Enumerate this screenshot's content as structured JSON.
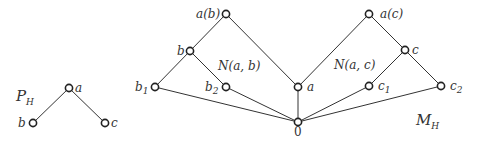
{
  "diagrams": [
    {
      "name": "P_H",
      "title": "P",
      "title_sub": "H",
      "title_pos": [
        16,
        101
      ],
      "nodes": [
        {
          "id": "a",
          "label": "a",
          "x": 69,
          "y": 88,
          "lx": 75,
          "ly": 92
        },
        {
          "id": "b",
          "label": "b",
          "x": 33,
          "y": 123,
          "lx": 18,
          "ly": 127
        },
        {
          "id": "c",
          "label": "c",
          "x": 105,
          "y": 123,
          "lx": 111,
          "ly": 127
        }
      ],
      "edges": [
        [
          "a",
          "b"
        ],
        [
          "a",
          "c"
        ]
      ]
    },
    {
      "name": "M_H",
      "title": "M",
      "title_sub": "H",
      "title_pos": [
        416,
        125
      ],
      "nodes": [
        {
          "id": "ab",
          "label": "a(b)",
          "x": 226,
          "y": 14,
          "lx": 196,
          "ly": 18
        },
        {
          "id": "b",
          "label": "b",
          "x": 190,
          "y": 51,
          "lx": 177,
          "ly": 55
        },
        {
          "id": "b1",
          "label": "b",
          "sub": "1",
          "x": 155,
          "y": 87,
          "lx": 135,
          "ly": 91
        },
        {
          "id": "b2",
          "label": "b",
          "sub": "2",
          "x": 226,
          "y": 87,
          "lx": 205,
          "ly": 91
        },
        {
          "id": "a",
          "label": "a",
          "x": 298,
          "y": 87,
          "lx": 307,
          "ly": 91
        },
        {
          "id": "zero",
          "label": "0",
          "x": 298,
          "y": 122,
          "lx": 294,
          "ly": 136,
          "roman": true
        },
        {
          "id": "ac",
          "label": "a(c)",
          "x": 369,
          "y": 14,
          "lx": 380,
          "ly": 18
        },
        {
          "id": "c",
          "label": "c",
          "x": 405,
          "y": 50,
          "lx": 412,
          "ly": 54
        },
        {
          "id": "c1",
          "label": "c",
          "sub": "1",
          "x": 369,
          "y": 86,
          "lx": 378,
          "ly": 90
        },
        {
          "id": "c2",
          "label": "c",
          "sub": "2",
          "x": 441,
          "y": 86,
          "lx": 450,
          "ly": 90
        }
      ],
      "edges": [
        [
          "ab",
          "b"
        ],
        [
          "ab",
          "a"
        ],
        [
          "b",
          "b1"
        ],
        [
          "b",
          "b2"
        ],
        [
          "b1",
          "zero"
        ],
        [
          "b2",
          "zero"
        ],
        [
          "a",
          "zero"
        ],
        [
          "ac",
          "a"
        ],
        [
          "ac",
          "c"
        ],
        [
          "c",
          "c1"
        ],
        [
          "c",
          "c2"
        ],
        [
          "c1",
          "zero"
        ],
        [
          "c2",
          "zero"
        ]
      ],
      "annotations": [
        {
          "text": "N(a, b)",
          "x": 218,
          "y": 70
        },
        {
          "text": "N(a, c)",
          "x": 334,
          "y": 69
        }
      ]
    }
  ]
}
